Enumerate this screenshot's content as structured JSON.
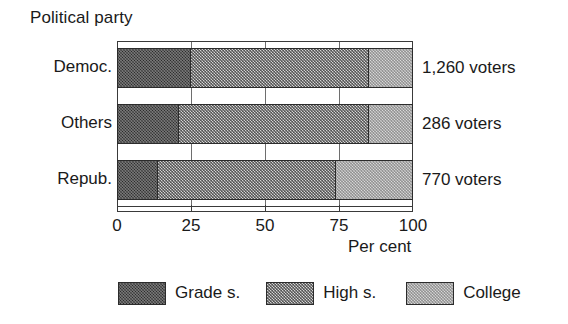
{
  "chart_data": {
    "type": "bar",
    "orientation": "horizontal",
    "stacked": true,
    "stack_mode": "percent",
    "title": "Political party",
    "xlabel": "Per cent",
    "ylabel": "Political party",
    "xlim": [
      0,
      100
    ],
    "xticks": [
      0,
      25,
      50,
      75,
      100
    ],
    "xtick_labels": [
      "0",
      "25",
      "50",
      "75",
      "100"
    ],
    "grid": true,
    "grid_axis": "x",
    "legend_position": "bottom",
    "categories": [
      "Democ.",
      "Others",
      "Repub."
    ],
    "series": [
      {
        "name": "Grade s.",
        "values": [
          25,
          21,
          14
        ],
        "color": "#2a2a2a"
      },
      {
        "name": "High s.",
        "values": [
          60,
          64,
          60
        ],
        "color": "#9b9b9b"
      },
      {
        "name": "College",
        "values": [
          15,
          15,
          26
        ],
        "color": "#dcdcdc"
      }
    ],
    "cumulative_boundaries": [
      {
        "category": "Democ.",
        "stops": [
          25,
          85,
          100
        ]
      },
      {
        "category": "Others",
        "stops": [
          21,
          85,
          100
        ]
      },
      {
        "category": "Repub.",
        "stops": [
          14,
          74,
          100
        ]
      }
    ],
    "annotations": [
      "1,260 voters",
      "286 voters",
      "770 voters"
    ]
  },
  "title": {
    "text": "Political party"
  },
  "categories": [
    {
      "label": "Democ.",
      "note": "1,260 voters",
      "top": 48,
      "note_top": 58,
      "segments": [
        {
          "series": "Grade s.",
          "start": 0,
          "end": 25,
          "fill": "fill-grade"
        },
        {
          "series": "High s.",
          "start": 25,
          "end": 85,
          "fill": "fill-high"
        },
        {
          "series": "College",
          "start": 85,
          "end": 100,
          "fill": "fill-college"
        }
      ]
    },
    {
      "label": "Others",
      "note": "286 voters",
      "top": 104,
      "note_top": 114,
      "segments": [
        {
          "series": "Grade s.",
          "start": 0,
          "end": 21,
          "fill": "fill-grade"
        },
        {
          "series": "High s.",
          "start": 21,
          "end": 85,
          "fill": "fill-high"
        },
        {
          "series": "College",
          "start": 85,
          "end": 100,
          "fill": "fill-college"
        }
      ]
    },
    {
      "label": "Repub.",
      "note": "770 voters",
      "top": 160,
      "note_top": 170,
      "segments": [
        {
          "series": "Grade s.",
          "start": 0,
          "end": 14,
          "fill": "fill-grade"
        },
        {
          "series": "High s.",
          "start": 14,
          "end": 74,
          "fill": "fill-high"
        },
        {
          "series": "College",
          "start": 74,
          "end": 100,
          "fill": "fill-college"
        }
      ]
    }
  ],
  "axis": {
    "title": "Per cent",
    "ticks": [
      {
        "value": 0,
        "label": "0"
      },
      {
        "value": 25,
        "label": "25"
      },
      {
        "value": 50,
        "label": "50"
      },
      {
        "value": 75,
        "label": "75"
      },
      {
        "value": 100,
        "label": "100"
      }
    ]
  },
  "legend": {
    "items": [
      {
        "label": "Grade s.",
        "fill": "fill-grade"
      },
      {
        "label": "High s.",
        "fill": "fill-high"
      },
      {
        "label": "College",
        "fill": "fill-college"
      }
    ]
  },
  "colors": {
    "grade": "#2a2a2a",
    "high": "#9b9b9b",
    "college": "#dcdcdc",
    "axis": "#3a3a3a",
    "text": "#1a1a1a",
    "background": "#ffffff"
  }
}
